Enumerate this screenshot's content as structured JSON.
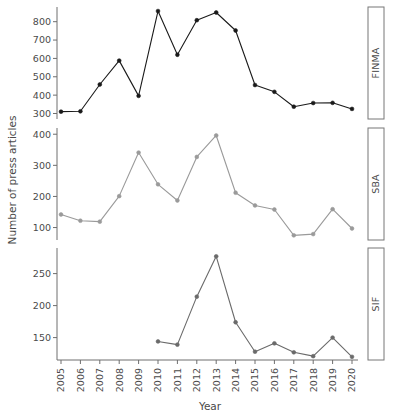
{
  "chart_data": {
    "type": "line",
    "title": "",
    "xlabel": "Year",
    "ylabel": "Number of press articles",
    "grid": false,
    "legend": "none",
    "layout": "3 stacked panels with right-side strip labels",
    "x": [
      2005,
      2006,
      2007,
      2008,
      2009,
      2010,
      2011,
      2012,
      2013,
      2014,
      2015,
      2016,
      2017,
      2018,
      2019,
      2020
    ],
    "categories": [
      "2005",
      "2006",
      "2007",
      "2008",
      "2009",
      "2010",
      "2011",
      "2012",
      "2013",
      "2014",
      "2015",
      "2016",
      "2017",
      "2018",
      "2019",
      "2020"
    ],
    "panels": [
      {
        "name": "FINMA",
        "strip_label": "FINMA",
        "color": "#1a1a1a",
        "yticks": [
          300,
          400,
          500,
          600,
          700,
          800
        ],
        "ytick_labels": [
          "300",
          "400",
          "500",
          "600",
          "700",
          "800"
        ],
        "ylim": [
          270,
          880
        ],
        "values": [
          310,
          312,
          458,
          588,
          396,
          858,
          620,
          808,
          850,
          752,
          455,
          418,
          337,
          357,
          358,
          325
        ]
      },
      {
        "name": "SBA",
        "strip_label": "SBA",
        "color": "#9a9a9a",
        "yticks": [
          100,
          200,
          300,
          400
        ],
        "ytick_labels": [
          "100",
          "200",
          "300",
          "400"
        ],
        "ylim": [
          60,
          420
        ],
        "values": [
          142,
          122,
          119,
          201,
          341,
          239,
          187,
          327,
          396,
          212,
          171,
          158,
          75,
          79,
          159,
          97
        ]
      },
      {
        "name": "SIF",
        "strip_label": "SIF",
        "color": "#6a6a6a",
        "yticks": [
          150,
          200,
          250
        ],
        "ytick_labels": [
          "150",
          "200",
          "250"
        ],
        "ylim": [
          115,
          290
        ],
        "values": [
          null,
          null,
          null,
          null,
          null,
          144,
          139,
          214,
          277,
          174,
          128,
          141,
          127,
          121,
          150,
          120
        ]
      }
    ]
  },
  "axis": {
    "y_title": "Number of press articles",
    "x_title": "Year"
  },
  "strips": {
    "panel1": "FINMA",
    "panel2": "SBA",
    "panel3": "SIF"
  }
}
